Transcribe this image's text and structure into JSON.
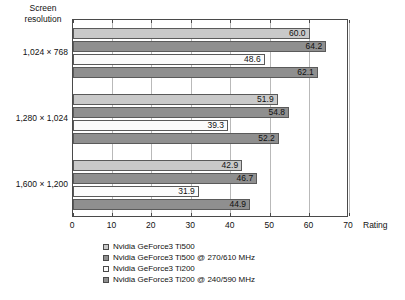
{
  "chart_data": {
    "type": "bar",
    "orientation": "horizontal",
    "title": "",
    "xlabel": "Rating",
    "ylabel": "Screen resolution",
    "xlim": [
      0,
      70
    ],
    "xticks": [
      0,
      10,
      20,
      30,
      40,
      50,
      60,
      70
    ],
    "grid": true,
    "legend_position": "bottom",
    "categories": [
      "1,024 × 768",
      "1,280 × 1,024",
      "1,600 × 1,200"
    ],
    "series": [
      {
        "name": "Nvidia GeForce3 Ti500",
        "swatch": "light-gray",
        "color": "#c9c9c9",
        "values": [
          60.0,
          51.9,
          42.9
        ],
        "labels": [
          "60.0",
          "51.9",
          "42.9"
        ]
      },
      {
        "name": "Nvidia GeForce3 Ti500 @ 270/610 MHz",
        "swatch": "dark-gray",
        "color": "#8f8f8f",
        "values": [
          64.2,
          54.8,
          46.7
        ],
        "labels": [
          "64.2",
          "54.8",
          "46.7"
        ]
      },
      {
        "name": "Nvidia GeForce3 Ti200",
        "swatch": "white",
        "color": "#fbfbfb",
        "values": [
          48.6,
          39.3,
          31.9
        ],
        "labels": [
          "48.6",
          "39.3",
          "31.9"
        ]
      },
      {
        "name": "Nvidia GeForce3 Ti200 @ 240/590 MHz",
        "swatch": "dark-gray",
        "color": "#8f8f8f",
        "values": [
          62.1,
          52.2,
          44.9
        ],
        "labels": [
          "62.1",
          "52.2",
          "44.9"
        ]
      }
    ]
  },
  "axes": {
    "category_axis_title": "Screen resolution",
    "value_axis_title": "Rating",
    "category_labels": [
      "1,024 × 768",
      "1,280 × 1,024",
      "1,600 × 1,200"
    ],
    "value_tick_labels": [
      "0",
      "10",
      "20",
      "30",
      "40",
      "50",
      "60",
      "70"
    ]
  },
  "legend": {
    "items": [
      {
        "label": "Nvidia GeForce3 Ti500",
        "swatch_color": "#c9c9c9"
      },
      {
        "label": "Nvidia GeForce3 Ti500 @ 270/610 MHz",
        "swatch_color": "#8f8f8f"
      },
      {
        "label": "Nvidia GeForce3 Ti200",
        "swatch_color": "#fbfbfb"
      },
      {
        "label": "Nvidia GeForce3 Ti200 @ 240/590 MHz",
        "swatch_color": "#8f8f8f"
      }
    ]
  }
}
